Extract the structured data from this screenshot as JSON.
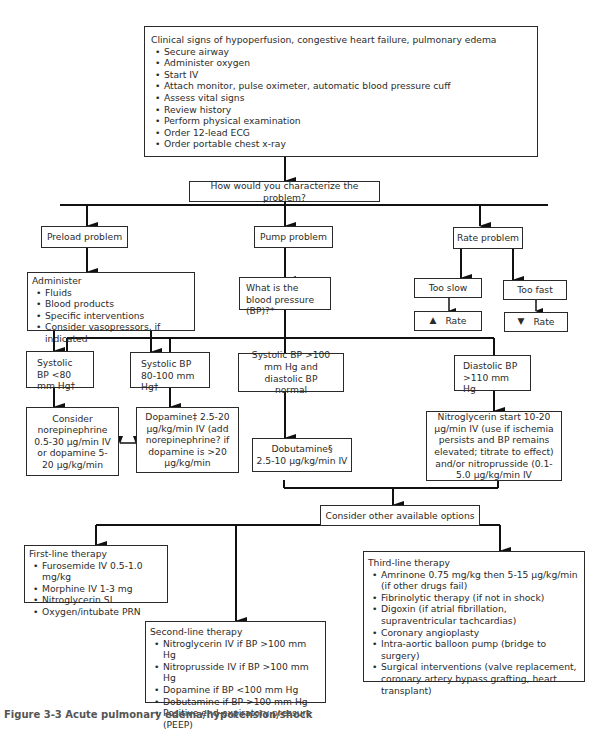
{
  "top_box": {
    "title": "Clinical signs of hypoperfusion, congestive heart failure, pulmonary edema",
    "items": [
      "Secure airway",
      "Administer oxygen",
      "Start IV",
      "Attach monitor, pulse oximeter, automatic blood pressure cuff",
      "Assess vital signs",
      "Review history",
      "Perform physical examination",
      "Order 12-lead ECG",
      "Order portable chest x-ray"
    ]
  },
  "question": "How would you characterize the problem?",
  "preload": {
    "label": "Preload problem",
    "administer_title": "Administer",
    "items": [
      "Fluids",
      "Blood products",
      "Specific interventions",
      "Consider vasopressors, if indicated"
    ]
  },
  "pump": {
    "label": "Pump problem",
    "bp_question": "What is the blood pressure (BP)?*"
  },
  "rate": {
    "label": "Rate problem",
    "too_slow": "Too slow",
    "too_fast": "Too fast",
    "increase_rate": "Rate",
    "decrease_rate": "Rate",
    "up_arrow_icon": "▲",
    "down_arrow_icon": "▼"
  },
  "bp_branches": {
    "sbp_low": "Systolic BP <80 mm Hg†",
    "sbp_mid": "Systolic BP 80-100 mm Hg†",
    "sbp_high": "Systolic BP >100 mm Hg and diastolic BP normal",
    "dbp_high": "Diastolic BP >110 mm Hg"
  },
  "treatments": {
    "norepinephrine": "Consider norepinephrine 0.5-30 µg/min IV or dopamine 5-20 µg/kg/min",
    "dopamine": "Dopamine‡ 2.5-20 µg/kg/min IV (add norepinephrine? if dopamine is >20 µg/kg/min",
    "dobutamine_line1": "Dobutamine§",
    "dobutamine_line2": "2.5-10 µg/kg/min IV",
    "nitro": "Nitroglycerin start 10-20 µg/min IV (use if ischemia persists and BP remains elevated; titrate to effect) and/or nitroprusside (0.1-5.0 µg/kg/min IV"
  },
  "other_options": "Consider other available options",
  "first_line": {
    "title": "First-line therapy",
    "items": [
      "Furosemide IV 0.5-1.0 mg/kg",
      "Morphine IV 1-3 mg",
      "Nitroglycerin SL",
      "Oxygen/intubate PRN"
    ]
  },
  "second_line": {
    "title": "Second-line therapy",
    "items": [
      "Nitroglycerin IV if BP >100 mm Hg",
      "Nitroprusside IV if BP >100 mm Hg",
      "Dopamine if BP <100 mm Hg",
      "Dobutamine if BP >100 mm Hg",
      "Positive end-expiratory pressure (PEEP)"
    ]
  },
  "third_line": {
    "title": "Third-line therapy",
    "items": [
      "Amrinone 0.75 mg/kg then 5-15 µg/kg/min (if other drugs fail)",
      "Fibrinolytic therapy (if not in shock)",
      "Digoxin (if atrial fibrillation, supraventricular tachcardias)",
      "Coronary angioplasty",
      "Intra-aortic balloon pump (bridge to surgery)",
      "Surgical interventions (valve replacement, coronary artery bypass grafting, heart transplant)"
    ]
  },
  "caption": "Figure 3-3 Acute pulmonary edema/hypotension/shock"
}
